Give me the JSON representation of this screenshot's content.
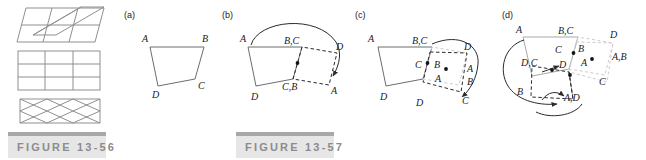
{
  "figure_56": {
    "caption": "FIGURE 13-56",
    "panels": [
      {
        "name": "sheared-grid",
        "rows": 2,
        "cols": 3,
        "description": "slanted parallelogram grid, 2 rows by 3 columns"
      },
      {
        "name": "rectangular-grid",
        "rows": 3,
        "cols": 3,
        "description": "upright rectangular grid, 3 rows by 3 columns"
      },
      {
        "name": "bowtie-grid",
        "rows": 2,
        "cols": 3,
        "description": "hourglass / bowtie tessellation band"
      }
    ]
  },
  "figure_57": {
    "caption": "FIGURE 13-57",
    "panels": [
      {
        "id": "a",
        "label": "(a)",
        "vertex_labels": [
          "A",
          "B",
          "C",
          "D"
        ],
        "description": "original quadrilateral ABCD with A top-left, B top-right, C lower-right, D bottom-left"
      },
      {
        "id": "b",
        "label": "(b)",
        "vertex_labels": [
          "A",
          "B,C",
          "C,B",
          "D",
          "A",
          "D"
        ],
        "description": "quadrilateral rotated about midpoint of side BC; arc arrow from A sweeping to new A position"
      },
      {
        "id": "c",
        "label": "(c)",
        "vertex_labels": [
          "A",
          "B,C",
          "C",
          "B",
          "A",
          "D",
          "D",
          "A",
          "B",
          "C"
        ],
        "description": "second rotation about midpoint; arc arrow sweeping down to C"
      },
      {
        "id": "d",
        "label": "(d)",
        "vertex_labels": [
          "A",
          "B,C",
          "D",
          "C",
          "B",
          "D,C",
          "D",
          "A",
          "A,B",
          "B",
          "A,D",
          "C"
        ],
        "description": "third rotation about midpoint; arc arrow from B sweeping to A,D"
      }
    ]
  },
  "colors": {
    "stroke": "#3a3a3a",
    "grid_stroke": "#8a8a8a",
    "faint_stroke": "#c9c9c9",
    "caption_bar": "#a8a8a8",
    "caption_bg": "#e6e6e6",
    "caption_text": "#8c8c8c"
  }
}
